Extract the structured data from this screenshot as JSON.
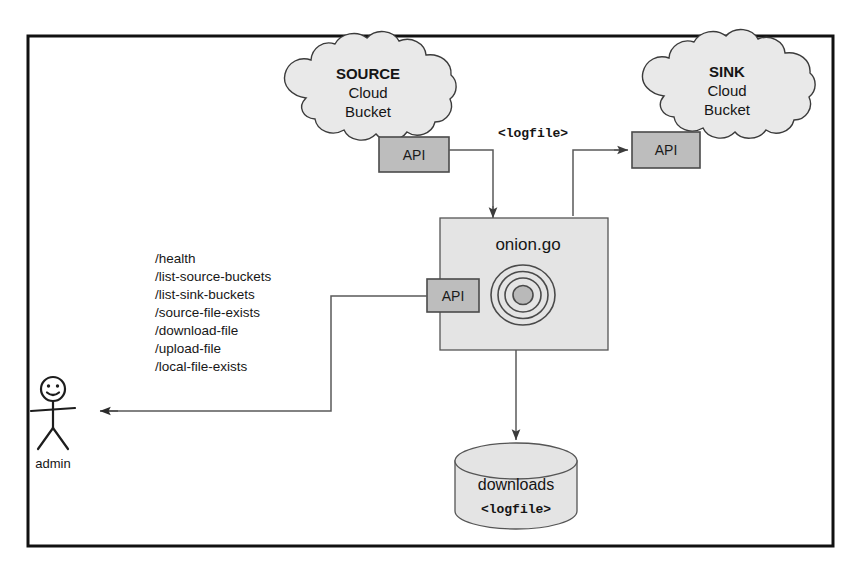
{
  "diagram": {
    "colors": {
      "cloud_fill": "#e9e9e9",
      "api_fill": "#bdbdbd",
      "process_fill": "#e4e4e4",
      "store_fill": "#e4e4e4",
      "stroke": "#3b3b3b",
      "frame": "#111111",
      "text": "#151515"
    },
    "frame": {
      "label": "diagram-border"
    },
    "source_cloud": {
      "title": "SOURCE",
      "line2": "Cloud",
      "line3": "Bucket",
      "api_label": "API"
    },
    "sink_cloud": {
      "title": "SINK",
      "line2": "Cloud",
      "line3": "Bucket",
      "api_label": "API"
    },
    "transfer_label": "<logfile>",
    "process": {
      "name": "onion.go",
      "api_label": "API",
      "icon": "onion-rings-icon"
    },
    "datastore": {
      "name": "downloads",
      "content": "<logfile>"
    },
    "actor": {
      "label": "admin",
      "icon": "stick-figure-icon"
    },
    "endpoints": [
      "/health",
      "/list-source-buckets",
      "/list-sink-buckets",
      "/source-file-exists",
      "/download-file",
      "/upload-file",
      "/local-file-exists"
    ],
    "connectors": [
      {
        "name": "source-api-to-onion",
        "from": "source_cloud.api",
        "to": "process"
      },
      {
        "name": "onion-to-sink-api",
        "from": "process",
        "to": "sink_cloud.api"
      },
      {
        "name": "onion-to-downloads",
        "from": "process",
        "to": "datastore"
      },
      {
        "name": "onion-api-to-admin",
        "from": "process.api",
        "to": "actor"
      }
    ]
  }
}
